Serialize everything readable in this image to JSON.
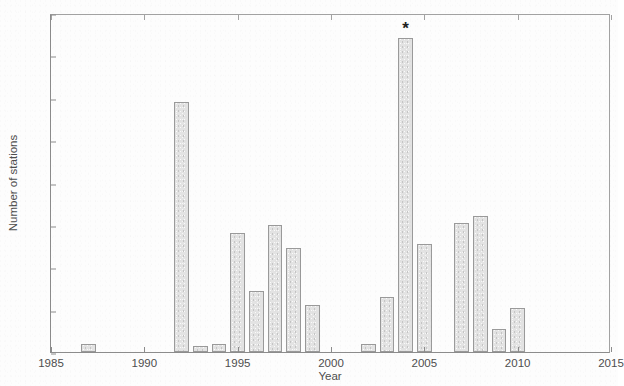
{
  "chart_data": {
    "type": "bar",
    "title": "",
    "xlabel": "Year",
    "ylabel": "Number of stations",
    "xlim": [
      1985,
      2015
    ],
    "ylim": [
      0,
      160
    ],
    "xticks": [
      1985,
      1990,
      1995,
      2000,
      2005,
      2010,
      2015
    ],
    "yticks": [
      0,
      20,
      40,
      60,
      80,
      100,
      120,
      140,
      160
    ],
    "grid": false,
    "legend": null,
    "bar_color": "#e3e3e3",
    "bar_edge_color": "#9a9a9a",
    "categories": [
      1987,
      1992,
      1993,
      1994,
      1995,
      1996,
      1997,
      1998,
      1999,
      2002,
      2003,
      2004,
      2005,
      2007,
      2008,
      2009,
      2010
    ],
    "values": [
      4,
      118,
      3,
      4,
      56,
      29,
      60,
      49,
      22,
      4,
      26,
      148,
      51,
      61,
      64,
      11,
      21
    ],
    "annotations": [
      {
        "label": "*",
        "x": 2004,
        "y": 155,
        "target_value": 148
      }
    ]
  },
  "axis": {
    "y_tick_labels": [
      "0",
      "20",
      "40",
      "60",
      "80",
      "100",
      "120",
      "140",
      "160"
    ],
    "x_tick_labels": [
      "1985",
      "1990",
      "1995",
      "2000",
      "2005",
      "2010",
      "2015"
    ],
    "y_axis_title": "Number of stations",
    "x_axis_title": "Year"
  }
}
